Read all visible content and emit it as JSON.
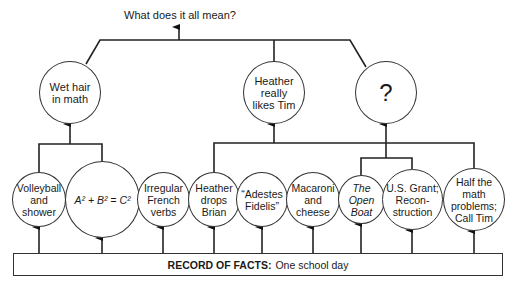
{
  "diagram": {
    "title": "What does it all mean?",
    "level2": [
      {
        "id": "wet-hair",
        "label": "Wet hair\nin math"
      },
      {
        "id": "heather-likes-tim",
        "label": "Heather\nreally\nlikes Tim"
      },
      {
        "id": "question",
        "label": "?"
      }
    ],
    "level1": [
      {
        "id": "volleyball",
        "label": "Volleyball\nand\nshower",
        "parent": "wet-hair"
      },
      {
        "id": "pythagoras",
        "label": "A² + B² = C²",
        "parent": "wet-hair"
      },
      {
        "id": "french-verbs",
        "label": "Irregular\nFrench\nverbs",
        "parent": null
      },
      {
        "id": "heather-drops-brian",
        "label": "Heather\ndrops\nBrian",
        "parent": "heather-likes-tim"
      },
      {
        "id": "adestes-fidelis",
        "label": "“Adestes\nFidelis”",
        "parent": null
      },
      {
        "id": "macaroni",
        "label": "Macaroni\nand\ncheese",
        "parent": null
      },
      {
        "id": "open-boat",
        "label": "The\nOpen\nBoat",
        "parent": "question"
      },
      {
        "id": "us-grant",
        "label": "U.S. Grant;\nRecon-\nstruction",
        "parent": "question"
      },
      {
        "id": "half-math",
        "label": "Half the\nmath\nproblems;\nCall Tim",
        "parent": "heather-likes-tim"
      }
    ],
    "record": {
      "label": "RECORD OF FACTS:",
      "value": "One school day"
    }
  }
}
